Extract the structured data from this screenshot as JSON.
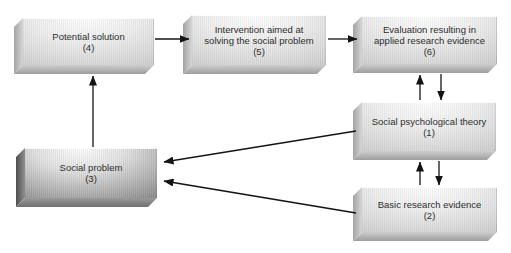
{
  "diagram": {
    "boxes": {
      "potential_solution": {
        "line1": "Potential solution",
        "line2": "(4)"
      },
      "intervention": {
        "line1": "Intervention aimed at",
        "line2": "solving the social problem",
        "line3": "(5)"
      },
      "evaluation": {
        "line1": "Evaluation resulting in",
        "line2": "applied research evidence",
        "line3": "(6)"
      },
      "social_theory": {
        "line1": "Social psychological theory",
        "line2": "(1)"
      },
      "basic_research": {
        "line1": "Basic research evidence",
        "line2": "(2)"
      },
      "social_problem": {
        "line1": "Social problem",
        "line2": "(3)"
      }
    },
    "arrows": [
      {
        "from": "potential_solution",
        "to": "intervention"
      },
      {
        "from": "intervention",
        "to": "evaluation"
      },
      {
        "from": "social_problem",
        "to": "potential_solution"
      },
      {
        "from": "social_theory",
        "to": "evaluation"
      },
      {
        "from": "evaluation",
        "to": "social_theory"
      },
      {
        "from": "basic_research",
        "to": "social_theory"
      },
      {
        "from": "social_theory",
        "to": "basic_research"
      },
      {
        "from": "social_theory",
        "to": "social_problem"
      },
      {
        "from": "basic_research",
        "to": "social_problem"
      }
    ],
    "colors": {
      "background": "#ffffff",
      "box_face_light": "#d6d6d6",
      "box_face_dark": "#8a8a8a",
      "arrow": "#141414",
      "text": "#2d2d2d"
    }
  }
}
